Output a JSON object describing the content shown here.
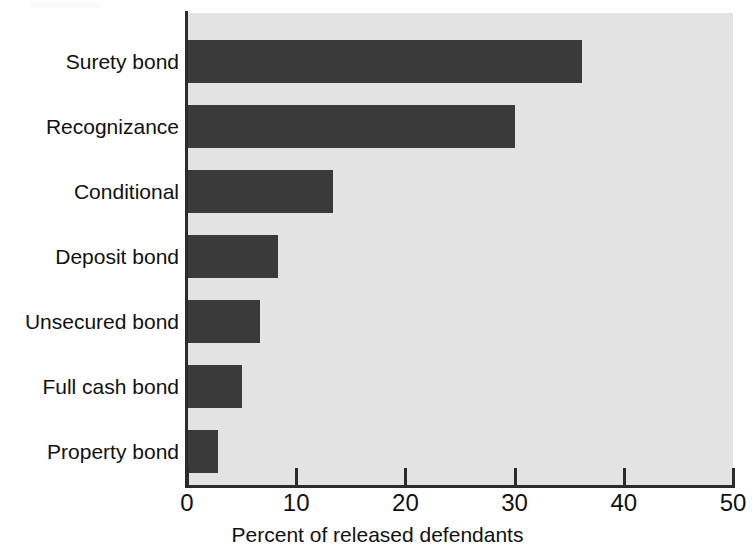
{
  "chart_data": {
    "type": "bar",
    "orientation": "horizontal",
    "title": "",
    "subtitle": "",
    "xlabel": "Percent of released defendants",
    "ylabel": "",
    "xlim": [
      0,
      50
    ],
    "xticks": [
      0,
      10,
      20,
      30,
      40,
      50
    ],
    "xtick_labels": [
      "0",
      "10",
      "20",
      "30",
      "40",
      "50"
    ],
    "grid": false,
    "legend": null,
    "categories": [
      "Surety bond",
      "Recognizance",
      "Conditional",
      "Deposit bond",
      "Unsecured bond",
      "Full cash bond",
      "Property bond"
    ],
    "values": [
      36.2,
      30.0,
      13.4,
      8.3,
      6.7,
      5.0,
      2.8
    ],
    "series": [
      {
        "name": "Percent of released defendants",
        "values": [
          36.2,
          30.0,
          13.4,
          8.3,
          6.7,
          5.0,
          2.8
        ]
      }
    ],
    "colors": {
      "bar": "#3a3a3a",
      "plot_background": "#e3e3e3",
      "axis": "#2b2b2b",
      "text": "#111111",
      "page_background": "#ffffff"
    }
  }
}
